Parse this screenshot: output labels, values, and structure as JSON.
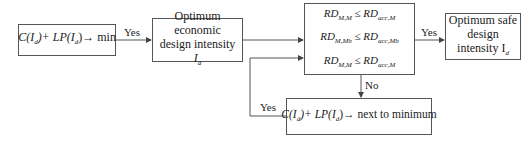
{
  "diagram": {
    "nodes": {
      "objective": {
        "expr_left": "C(I",
        "sub": "d",
        "expr_mid": ")+ LP(I",
        "expr_right": ")",
        "arrow": "→",
        "target": "min"
      },
      "economic": {
        "line1": "Optimum economic",
        "line2": "design intensity",
        "line3": "I",
        "line3_sub": "d"
      },
      "check": {
        "rows": [
          {
            "lhs": "RD",
            "lhs_sub": "M,M",
            "lhs_subsub": "s3",
            "op": "≤",
            "rhs": "RD",
            "rhs_sub": "acc,M",
            "rhs_subsub": "s3"
          },
          {
            "lhs": "RD",
            "lhs_sub": "M,Mb",
            "lhs_subsub": "3",
            "op": "≤",
            "rhs": "RD",
            "rhs_sub": "acc,Mb",
            "rhs_subsub": "3"
          },
          {
            "lhs": "RD",
            "lhs_sub": "M,M",
            "lhs_subsub": "3",
            "op": "≤",
            "rhs": "RD",
            "rhs_sub": "acc,M",
            "rhs_subsub": "3"
          }
        ]
      },
      "safe": {
        "line1": "Optimum safe",
        "line2": "design",
        "line3": "intensity I",
        "line3_sub": "d"
      },
      "next": {
        "expr": "C(I",
        "sub": "d",
        "expr_mid": ")+ LP(I",
        "expr_right": ")",
        "arrow": "→",
        "target": "next to minimum"
      }
    },
    "edges": {
      "yes1": "Yes",
      "yes2": "Yes",
      "no": "No",
      "yes_loop": "Yes"
    }
  }
}
